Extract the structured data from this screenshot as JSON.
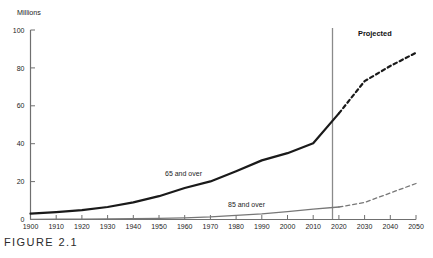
{
  "figure": {
    "caption": "FIGURE 2.1"
  },
  "chart_data": {
    "type": "line",
    "title": "",
    "subtitle": "",
    "xlabel": "",
    "ylabel": "Millions",
    "ylim": [
      0,
      100
    ],
    "xlim": [
      1900,
      2050
    ],
    "yticks": [
      0,
      20,
      40,
      60,
      80,
      100
    ],
    "ytick_labels": [
      "0",
      "20",
      "40",
      "60",
      "80",
      "100"
    ],
    "grid": false,
    "legend_position": "inline-annotation",
    "x": [
      1900,
      1910,
      1920,
      1930,
      1940,
      1950,
      1960,
      1970,
      1980,
      1990,
      2000,
      2010,
      2020,
      2030,
      2040,
      2050
    ],
    "xtick_labels": [
      "1900",
      "1910",
      "1920",
      "1930",
      "1940",
      "1950",
      "1960",
      "1970",
      "1980",
      "1990",
      "2000",
      "2010",
      "2020",
      "2030",
      "2040",
      "2050"
    ],
    "projection_start_year": 2020,
    "projection_label": "Projected",
    "series": [
      {
        "name": "65 and over",
        "color": "#1a1a1a",
        "label_x": 1970,
        "label_y": 26,
        "values": [
          3.1,
          3.9,
          4.9,
          6.6,
          9.0,
          12.3,
          16.6,
          20.1,
          25.5,
          31.2,
          35.0,
          40.2,
          56.0,
          73.0,
          81.0,
          88.0
        ]
      },
      {
        "name": "85 and over",
        "color": "#777777",
        "label_x": 1988,
        "label_y": 8,
        "values": [
          0.1,
          0.2,
          0.2,
          0.3,
          0.4,
          0.6,
          0.9,
          1.4,
          2.2,
          3.0,
          4.2,
          5.5,
          6.6,
          9.0,
          14.0,
          19.0
        ]
      }
    ],
    "annotations": [
      {
        "text": "Projected",
        "x": 2030,
        "y": 96
      },
      {
        "text": "65 and over",
        "x": 1970,
        "y": 26
      },
      {
        "text": "85 and over",
        "x": 1988,
        "y": 8
      }
    ]
  }
}
